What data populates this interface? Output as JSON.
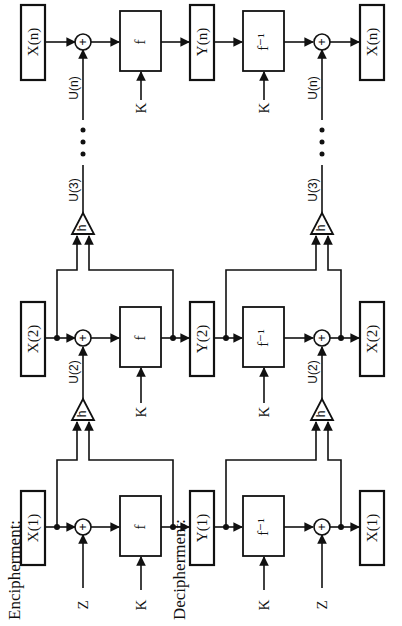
{
  "headers": {
    "encipherment": "Encipherment:",
    "decipherment": "Decipherment:"
  },
  "encipherment": {
    "blocks": [
      {
        "input": "X(1)",
        "func": "f",
        "key": "K",
        "chain_in": "Z",
        "output": "Y(1)"
      },
      {
        "input": "X(2)",
        "func": "f",
        "key": "K",
        "chain_in": "U(2)",
        "output": "Y(2)"
      },
      {
        "input": "X(n)",
        "func": "f",
        "key": "K",
        "chain_in": "U(n)",
        "output": "Y(n)"
      }
    ],
    "h_label": "h",
    "u3_label": "U(3)",
    "ellipsis": "• • •"
  },
  "decipherment": {
    "blocks": [
      {
        "input": "Y(1)",
        "func": "f⁻¹",
        "key": "K",
        "chain_in": "Z",
        "output": "X(1)"
      },
      {
        "input": "Y(2)",
        "func": "f⁻¹",
        "key": "K",
        "chain_in": "U(2)",
        "output": "X(2)"
      },
      {
        "input": "Y(n)",
        "func": "f⁻¹",
        "key": "K",
        "chain_in": "U(n)",
        "output": "X(n)"
      }
    ],
    "h_label": "h",
    "u3_label": "U(3)",
    "ellipsis": "• • •"
  },
  "adder_symbol": "+",
  "colors": {
    "ink": "#111111",
    "background": "#ffffff"
  }
}
